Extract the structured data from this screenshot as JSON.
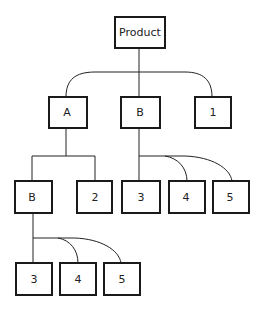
{
  "diagram": {
    "type": "tree",
    "nodes": [
      {
        "id": "product",
        "label": "Product"
      },
      {
        "id": "a",
        "label": "A"
      },
      {
        "id": "b1",
        "label": "B"
      },
      {
        "id": "n1",
        "label": "1"
      },
      {
        "id": "b2",
        "label": "B"
      },
      {
        "id": "n2",
        "label": "2"
      },
      {
        "id": "b1_3",
        "label": "3"
      },
      {
        "id": "b1_4",
        "label": "4"
      },
      {
        "id": "b1_5",
        "label": "5"
      },
      {
        "id": "b2_3",
        "label": "3"
      },
      {
        "id": "b2_4",
        "label": "4"
      },
      {
        "id": "b2_5",
        "label": "5"
      }
    ],
    "edges": [
      [
        "product",
        "a"
      ],
      [
        "product",
        "b1"
      ],
      [
        "product",
        "n1"
      ],
      [
        "a",
        "b2"
      ],
      [
        "a",
        "n2"
      ],
      [
        "b1",
        "b1_3"
      ],
      [
        "b1",
        "b1_4"
      ],
      [
        "b1",
        "b1_5"
      ],
      [
        "b2",
        "b2_3"
      ],
      [
        "b2",
        "b2_4"
      ],
      [
        "b2",
        "b2_5"
      ]
    ]
  }
}
